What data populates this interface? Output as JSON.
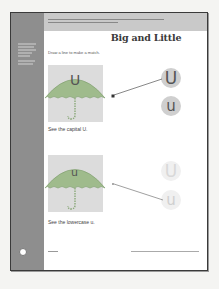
{
  "page": {
    "title": "Big and Little",
    "instruction": "Draw a line to make a match.",
    "colors": {
      "sidebar": "#8e8e8e",
      "header_band": "#c9c9c9",
      "umbrella": "#9fbb8c",
      "illustration_bg": "#dcdcdc",
      "circle_dark": "#cfcfcf",
      "circle_light": "#f0f0f0"
    }
  },
  "sidebar": {
    "tag": "",
    "skills": []
  },
  "exercises": [
    {
      "umbrella_letter": "U",
      "caption": "See the capital U.",
      "choices": [
        "U",
        "u"
      ],
      "matched_index": 0
    },
    {
      "umbrella_letter": "u",
      "caption": "See the lowercase u.",
      "choices": [
        "U",
        "u"
      ],
      "matched_index": 1
    }
  ],
  "footer": {
    "page_badge": "",
    "unit": "",
    "credit": ""
  }
}
